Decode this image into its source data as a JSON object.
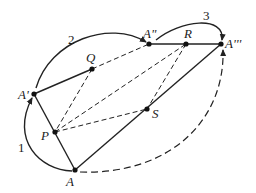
{
  "diagram": {
    "points": [
      {
        "id": "A",
        "label": "A",
        "x": 75,
        "y": 170,
        "lx": 66,
        "ly": 186
      },
      {
        "id": "A1",
        "label": "A'",
        "x": 34,
        "y": 94,
        "lx": 18,
        "ly": 99
      },
      {
        "id": "A2",
        "label": "A\"",
        "x": 149,
        "y": 44,
        "lx": 143,
        "ly": 38
      },
      {
        "id": "A3",
        "label": "A'''",
        "x": 221,
        "y": 44,
        "lx": 225,
        "ly": 48
      },
      {
        "id": "P",
        "label": "P",
        "x": 55,
        "y": 132,
        "lx": 41,
        "ly": 140
      },
      {
        "id": "Q",
        "label": "Q",
        "x": 92,
        "y": 69,
        "lx": 86,
        "ly": 62
      },
      {
        "id": "R",
        "label": "R",
        "x": 186,
        "y": 44,
        "lx": 184,
        "ly": 38
      },
      {
        "id": "S",
        "label": "S",
        "x": 147,
        "y": 109,
        "lx": 152,
        "ly": 118
      }
    ],
    "solid_segments": [
      [
        "A",
        "A1"
      ],
      [
        "A1",
        "Q"
      ],
      [
        "A2",
        "A3"
      ],
      [
        "A",
        "A3"
      ]
    ],
    "dashed_segments": [
      [
        "Q",
        "A2"
      ],
      [
        "Q",
        "P"
      ],
      [
        "P",
        "S"
      ],
      [
        "P",
        "R"
      ],
      [
        "R",
        "S"
      ],
      [
        "S",
        "A"
      ]
    ],
    "arc_labels": [
      {
        "text": "1",
        "x": 18,
        "y": 152
      },
      {
        "text": "2",
        "x": 68,
        "y": 44
      },
      {
        "text": "3",
        "x": 203,
        "y": 20
      }
    ]
  }
}
